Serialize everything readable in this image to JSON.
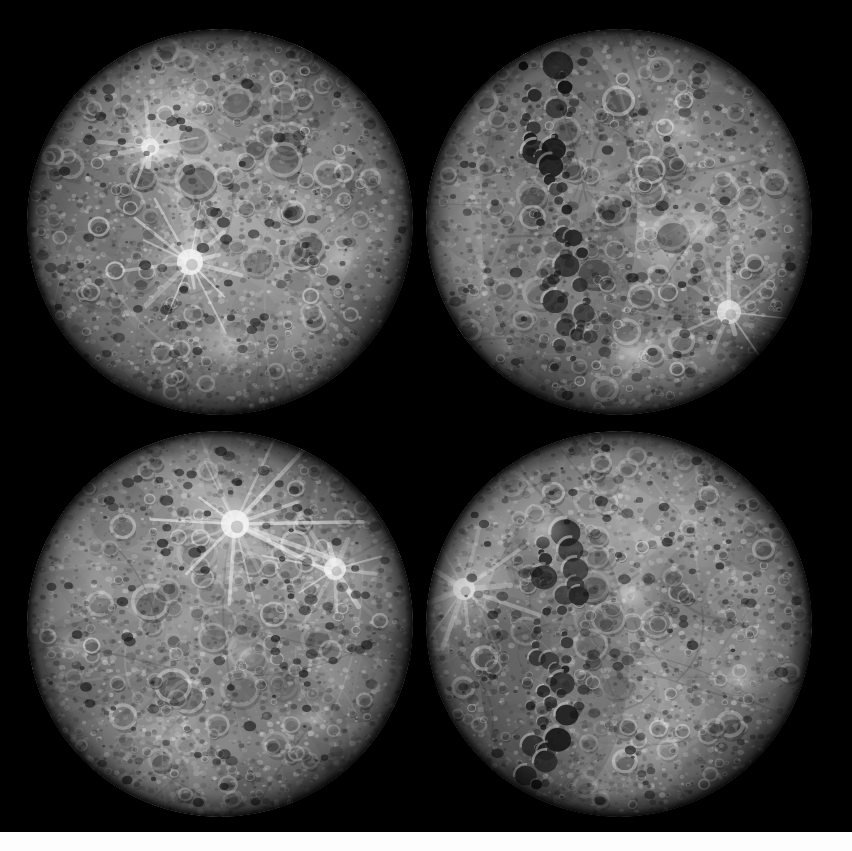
{
  "image": {
    "title": "Mercury Global Mosaic — Four Rotational Views",
    "subject": "Mercury",
    "background_color": "#000000",
    "canvas": {
      "width": 852,
      "height": 851
    },
    "bottom_strip": {
      "color": "#fdfdfd",
      "y": 832,
      "height": 19
    }
  },
  "palette": {
    "space": "#000000",
    "terrain_dark": "#3a3a3a",
    "terrain_mid": "#8d8d8d",
    "terrain_light": "#c9c9c9",
    "highlight": "#f2f2f2",
    "shadow": "#1b1b1b",
    "limb_shadow": "#0d0d0d"
  },
  "globes": [
    {
      "id": "globe-top-left",
      "name": "mercury-view-top-left",
      "label": "Mercury hemisphere view 1",
      "cx": 220,
      "cy": 222,
      "r": 193,
      "terminator_side": "none",
      "seed": 11,
      "features": [
        {
          "type": "ray-crater",
          "name": "bright-ray-crater-center-left",
          "x": -30,
          "y": 40,
          "r": 13,
          "rays": 14,
          "ray_len": 58,
          "brightness": 0.95
        },
        {
          "type": "ray-crater",
          "name": "bright-ray-crater-upper-left",
          "x": -70,
          "y": -75,
          "r": 9,
          "rays": 10,
          "ray_len": 40,
          "brightness": 0.85
        },
        {
          "type": "bright-patch",
          "name": "bright-plains-lower-center",
          "x": 10,
          "y": 120,
          "r": 26,
          "brightness": 0.7
        },
        {
          "type": "bright-patch",
          "name": "bright-plains-right",
          "x": 120,
          "y": 35,
          "r": 22,
          "brightness": 0.66
        },
        {
          "type": "bright-patch",
          "name": "bright-highlands-top",
          "x": -35,
          "y": -120,
          "r": 30,
          "brightness": 0.62
        }
      ]
    },
    {
      "id": "globe-top-right",
      "name": "mercury-view-top-right",
      "label": "Mercury hemisphere view 2 (terminator with crater chain)",
      "cx": 619,
      "cy": 222,
      "r": 193,
      "terminator_side": "left-of-center",
      "seed": 27,
      "features": [
        {
          "type": "crater-chain",
          "name": "shadowed-crater-chain",
          "x": -60,
          "y": -10,
          "length": 300,
          "width": 52,
          "count": 46,
          "tilt": -6
        },
        {
          "type": "bright-patch",
          "name": "bright-plains-right-upper",
          "x": 80,
          "y": 5,
          "r": 24,
          "brightness": 0.72
        },
        {
          "type": "ray-crater",
          "name": "bright-ray-crater-right",
          "x": 110,
          "y": 90,
          "r": 12,
          "rays": 11,
          "ray_len": 45,
          "brightness": 0.8
        },
        {
          "type": "bright-patch",
          "name": "bright-plains-lower-center",
          "x": 15,
          "y": 130,
          "r": 22,
          "brightness": 0.66
        },
        {
          "type": "bright-patch",
          "name": "bright-highlands-upper-right",
          "x": 55,
          "y": -95,
          "r": 26,
          "brightness": 0.6
        }
      ]
    },
    {
      "id": "globe-bottom-left",
      "name": "mercury-view-bottom-left",
      "label": "Mercury hemisphere view 3 (prominent ray crater)",
      "cx": 220,
      "cy": 624,
      "r": 193,
      "terminator_side": "none",
      "seed": 43,
      "features": [
        {
          "type": "ray-crater",
          "name": "hokusai-type-ray-crater",
          "x": 15,
          "y": -100,
          "r": 14,
          "rays": 16,
          "ray_len": 95,
          "brightness": 1.0
        },
        {
          "type": "ray-crater",
          "name": "bright-ray-crater-right",
          "x": 115,
          "y": -55,
          "r": 11,
          "rays": 10,
          "ray_len": 55,
          "brightness": 0.86
        },
        {
          "type": "bright-patch",
          "name": "bright-plains-left-limb",
          "x": -150,
          "y": 20,
          "r": 20,
          "brightness": 0.7
        },
        {
          "type": "bright-patch",
          "name": "bright-plains-center",
          "x": 25,
          "y": 30,
          "r": 18,
          "brightness": 0.64
        },
        {
          "type": "bright-patch",
          "name": "bright-plains-lower-right",
          "x": 95,
          "y": 95,
          "r": 20,
          "brightness": 0.62
        }
      ]
    },
    {
      "id": "globe-bottom-right",
      "name": "mercury-view-bottom-right",
      "label": "Mercury hemisphere view 4 (terminator with crater chain)",
      "cx": 619,
      "cy": 624,
      "r": 193,
      "terminator_side": "left-of-center",
      "seed": 59,
      "features": [
        {
          "type": "crater-chain",
          "name": "shadowed-crater-chain",
          "x": -65,
          "y": 35,
          "length": 250,
          "width": 50,
          "count": 38,
          "tilt": 5
        },
        {
          "type": "ray-crater",
          "name": "bright-ray-crater-left-limb",
          "x": -155,
          "y": -35,
          "r": 11,
          "rays": 12,
          "ray_len": 60,
          "brightness": 0.92
        },
        {
          "type": "bright-patch",
          "name": "bright-plains-center",
          "x": 10,
          "y": -30,
          "r": 16,
          "brightness": 0.78
        },
        {
          "type": "bright-patch",
          "name": "bright-plains-upper-left",
          "x": -75,
          "y": -95,
          "r": 22,
          "brightness": 0.7
        },
        {
          "type": "bright-patch",
          "name": "bright-plains-right",
          "x": 120,
          "y": 55,
          "r": 20,
          "brightness": 0.66
        }
      ]
    }
  ]
}
